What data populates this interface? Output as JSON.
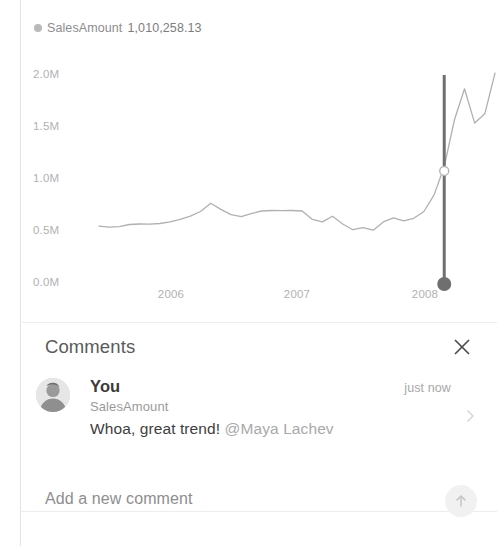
{
  "chart_data": {
    "type": "line",
    "title": "",
    "xlabel": "",
    "ylabel": "",
    "legend": {
      "name": "SalesAmount",
      "value": "1,010,258.13",
      "marker_color": "#b9b9b9",
      "position": "top-left"
    },
    "series": [
      {
        "name": "SalesAmount",
        "color": "#b0b0b0",
        "x": [
          0,
          1,
          2,
          3,
          4,
          5,
          6,
          7,
          8,
          9,
          10,
          11,
          12,
          13,
          14,
          15,
          16,
          17,
          18,
          19,
          20,
          21,
          22,
          23,
          24,
          25,
          26,
          27,
          28,
          29,
          30,
          31,
          32,
          33,
          34,
          35,
          36,
          37,
          38,
          39
        ],
        "values": [
          480000,
          470000,
          475000,
          495000,
          500000,
          498000,
          505000,
          520000,
          545000,
          575000,
          620000,
          700000,
          640000,
          590000,
          570000,
          600000,
          625000,
          630000,
          628000,
          630000,
          625000,
          545000,
          520000,
          575000,
          500000,
          445000,
          465000,
          440000,
          520000,
          560000,
          530000,
          555000,
          620000,
          780000,
          1050000,
          1500000,
          1800000,
          1470000,
          1560000,
          1950000
        ]
      }
    ],
    "ylim": [
      0,
      2100000
    ],
    "y_ticks": [
      "0.0M",
      "0.5M",
      "1.0M",
      "1.5M",
      "2.0M"
    ],
    "y_tick_values": [
      0,
      500000,
      1000000,
      1500000,
      2000000
    ],
    "x_ticks": [
      "2006",
      "2007",
      "2008"
    ],
    "x_tick_positions": [
      7.5,
      19.5,
      31.5
    ],
    "grid": false,
    "annotation": {
      "type": "vertical-tooltip-line",
      "x_index": 34,
      "marker_value": 1010258.13,
      "line_color": "#6f6f6f",
      "handle_color": "#6f6f6f",
      "handle_position": "bottom"
    }
  },
  "chart": {
    "legend_name": "SalesAmount",
    "legend_value": "1,010,258.13",
    "y_ticks": [
      "2.0M",
      "1.5M",
      "1.0M",
      "0.5M",
      "0.0M"
    ],
    "x_ticks": [
      "2006",
      "2007",
      "2008"
    ]
  },
  "comments": {
    "title": "Comments",
    "close_icon": "close-icon",
    "items": [
      {
        "author": "You",
        "measure": "SalesAmount",
        "time": "just now",
        "body_text": "Whoa, great trend! ",
        "mention": "@Maya Lachev",
        "avatar_icon": "user-photo-avatar",
        "chevron_icon": "chevron-right-icon"
      }
    ],
    "new_comment": {
      "placeholder": "Add a new comment",
      "value": "",
      "send_icon": "arrow-up-icon"
    }
  },
  "colors": {
    "line": "#b0b0b0",
    "annotation": "#6f6f6f",
    "axis_label": "#b2b2b2",
    "divider": "#ededed",
    "send_bg": "#f1f1f1"
  }
}
